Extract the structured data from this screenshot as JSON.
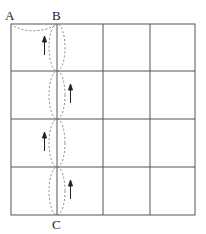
{
  "diagram": {
    "type": "grid-path",
    "grid": {
      "rows": 4,
      "cols": 4
    },
    "labels": {
      "A": "A",
      "B": "B",
      "C": "C"
    },
    "points": {
      "A": "top-left corner",
      "B": "top of second vertical line",
      "C": "bottom of second vertical line"
    },
    "paths": [
      {
        "from": "A",
        "to": "B",
        "style": "dashed curve"
      },
      {
        "segment": 1,
        "style": "dashed ellipse",
        "arrow": "up",
        "arrow_side": "left"
      },
      {
        "segment": 2,
        "style": "dashed ellipse",
        "arrow": "up",
        "arrow_side": "right"
      },
      {
        "segment": 3,
        "style": "dashed ellipse",
        "arrow": "up",
        "arrow_side": "left"
      },
      {
        "segment": 4,
        "style": "dashed ellipse",
        "arrow": "up",
        "arrow_side": "right"
      }
    ],
    "colors": {
      "grid": "#555555",
      "dashed": "#888888",
      "arrow": "#222222"
    }
  }
}
